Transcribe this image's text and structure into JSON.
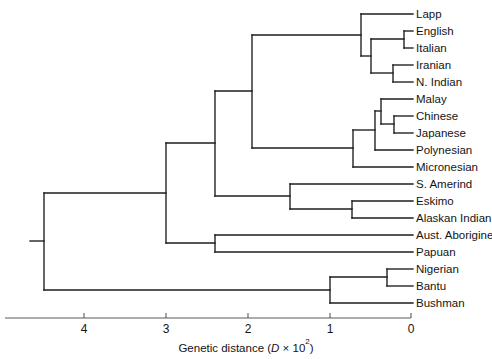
{
  "figure": {
    "type": "dendrogram",
    "orientation": "right-to-left",
    "title": ""
  },
  "axis": {
    "label_prefix": "Genetic distance (",
    "label_variable": "D",
    "label_middle": " × 10",
    "label_exponent": "2",
    "label_suffix": ")",
    "full_label": "Genetic distance (D × 10²)",
    "ticks": [
      {
        "value": "4",
        "x": 84
      },
      {
        "value": "3",
        "x": 166
      },
      {
        "value": "2",
        "x": 248
      },
      {
        "value": "1",
        "x": 330
      },
      {
        "value": "0",
        "x": 411
      }
    ],
    "line": {
      "x1": 5,
      "x2": 411,
      "y": 318
    },
    "tick_label_y": 333,
    "title_y": 352,
    "title_x": 246,
    "direction": "decreasing-left-to-right",
    "units_per_pixel": 0.012195
  },
  "chart_data": {
    "type": "tree",
    "xlabel": "Genetic distance (D × 10²)",
    "ylabel": "",
    "xlim": [
      5.0,
      0.0
    ],
    "grid": false,
    "legend": "none",
    "leaves": [
      {
        "name": "Lapp",
        "y": 14,
        "branch_x": 361
      },
      {
        "name": "English",
        "y": 31,
        "branch_x": 404
      },
      {
        "name": "Italian",
        "y": 48,
        "branch_x": 404
      },
      {
        "name": "Iranian",
        "y": 65,
        "branch_x": 393
      },
      {
        "name": "N. Indian",
        "y": 82,
        "branch_x": 393
      },
      {
        "name": "Malay",
        "y": 99,
        "branch_x": 381
      },
      {
        "name": "Chinese",
        "y": 116,
        "branch_x": 394
      },
      {
        "name": "Japanese",
        "y": 133,
        "branch_x": 394
      },
      {
        "name": "Polynesian",
        "y": 150,
        "branch_x": 375
      },
      {
        "name": "Micronesian",
        "y": 167,
        "branch_x": 353
      },
      {
        "name": "S. Amerind",
        "y": 184,
        "branch_x": 290
      },
      {
        "name": "Eskimo",
        "y": 201,
        "branch_x": 352
      },
      {
        "name": "Alaskan Indian",
        "y": 218,
        "branch_x": 352
      },
      {
        "name": "Aust. Aborigine",
        "y": 235,
        "branch_x": 215
      },
      {
        "name": "Papuan",
        "y": 252,
        "branch_x": 215
      },
      {
        "name": "Nigerian",
        "y": 269,
        "branch_x": 387
      },
      {
        "name": "Bantu",
        "y": 286,
        "branch_x": 387
      },
      {
        "name": "Bushman",
        "y": 303,
        "branch_x": 330
      }
    ],
    "label_x": 416,
    "nodes": [
      {
        "id": "english-italian",
        "x": 404,
        "y_top": 31,
        "y_bot": 48
      },
      {
        "id": "iranian-nindian",
        "x": 393,
        "y_top": 65,
        "y_bot": 82
      },
      {
        "id": "caucasoid-core",
        "x": 371,
        "y_top": 39,
        "y_bot": 73
      },
      {
        "id": "caucasoid",
        "x": 361,
        "y_top": 14,
        "y_bot": 56
      },
      {
        "id": "chinese-japanese",
        "x": 394,
        "y_top": 116,
        "y_bot": 133
      },
      {
        "id": "malay-sino",
        "x": 381,
        "y_top": 99,
        "y_bot": 124
      },
      {
        "id": "southeast-asian",
        "x": 375,
        "y_top": 111,
        "y_bot": 150
      },
      {
        "id": "asian",
        "x": 353,
        "y_top": 130,
        "y_bot": 167
      },
      {
        "id": "eurasian",
        "x": 252,
        "y_top": 35,
        "y_bot": 148
      },
      {
        "id": "eskimo-alaskan",
        "x": 352,
        "y_top": 201,
        "y_bot": 218
      },
      {
        "id": "amerind-arctic",
        "x": 290,
        "y_top": 184,
        "y_bot": 209
      },
      {
        "id": "non-african",
        "x": 215,
        "y_top": 91,
        "y_bot": 196
      },
      {
        "id": "aust-papuan",
        "x": 215,
        "y_top": 235,
        "y_bot": 252
      },
      {
        "id": "oceanic-split",
        "x": 166,
        "y_top": 143,
        "y_bot": 243
      },
      {
        "id": "nigerian-bantu",
        "x": 387,
        "y_top": 269,
        "y_bot": 286
      },
      {
        "id": "african",
        "x": 330,
        "y_top": 277,
        "y_bot": 303
      },
      {
        "id": "root",
        "x": 44,
        "y_top": 193,
        "y_bot": 290
      }
    ],
    "root_stub": {
      "x1": 30,
      "x2": 44,
      "y": 241
    },
    "connectors": [
      {
        "from_x": 404,
        "to_x": 413,
        "y": 31
      },
      {
        "from_x": 404,
        "to_x": 413,
        "y": 48
      },
      {
        "from_x": 393,
        "to_x": 413,
        "y": 65
      },
      {
        "from_x": 393,
        "to_x": 413,
        "y": 82
      },
      {
        "from_x": 381,
        "to_x": 413,
        "y": 99
      },
      {
        "from_x": 394,
        "to_x": 413,
        "y": 116
      },
      {
        "from_x": 394,
        "to_x": 413,
        "y": 133
      },
      {
        "from_x": 375,
        "to_x": 413,
        "y": 150
      },
      {
        "from_x": 353,
        "to_x": 413,
        "y": 167
      },
      {
        "from_x": 290,
        "to_x": 413,
        "y": 184
      },
      {
        "from_x": 352,
        "to_x": 413,
        "y": 201
      },
      {
        "from_x": 352,
        "to_x": 413,
        "y": 218
      },
      {
        "from_x": 215,
        "to_x": 413,
        "y": 235
      },
      {
        "from_x": 215,
        "to_x": 413,
        "y": 252
      },
      {
        "from_x": 387,
        "to_x": 413,
        "y": 269
      },
      {
        "from_x": 387,
        "to_x": 413,
        "y": 286
      },
      {
        "from_x": 330,
        "to_x": 413,
        "y": 303
      },
      {
        "from_x": 361,
        "to_x": 413,
        "y": 14
      },
      {
        "from_x": 371,
        "to_x": 404,
        "y": 39
      },
      {
        "from_x": 371,
        "to_x": 393,
        "y": 73
      },
      {
        "from_x": 361,
        "to_x": 371,
        "y": 56
      },
      {
        "from_x": 375,
        "to_x": 381,
        "y": 111
      },
      {
        "from_x": 381,
        "to_x": 394,
        "y": 124
      },
      {
        "from_x": 353,
        "to_x": 375,
        "y": 130
      },
      {
        "from_x": 252,
        "to_x": 361,
        "y": 35
      },
      {
        "from_x": 252,
        "to_x": 353,
        "y": 148
      },
      {
        "from_x": 290,
        "to_x": 352,
        "y": 209
      },
      {
        "from_x": 215,
        "to_x": 252,
        "y": 91
      },
      {
        "from_x": 215,
        "to_x": 290,
        "y": 196
      },
      {
        "from_x": 166,
        "to_x": 215,
        "y": 143
      },
      {
        "from_x": 166,
        "to_x": 215,
        "y": 243
      },
      {
        "from_x": 330,
        "to_x": 387,
        "y": 277
      },
      {
        "from_x": 44,
        "to_x": 166,
        "y": 193
      },
      {
        "from_x": 44,
        "to_x": 330,
        "y": 290
      }
    ],
    "colors": {
      "branch": "#1c1c1c",
      "axis": "#5a5a5a",
      "text": "#141414",
      "background": "#ffffff"
    }
  }
}
